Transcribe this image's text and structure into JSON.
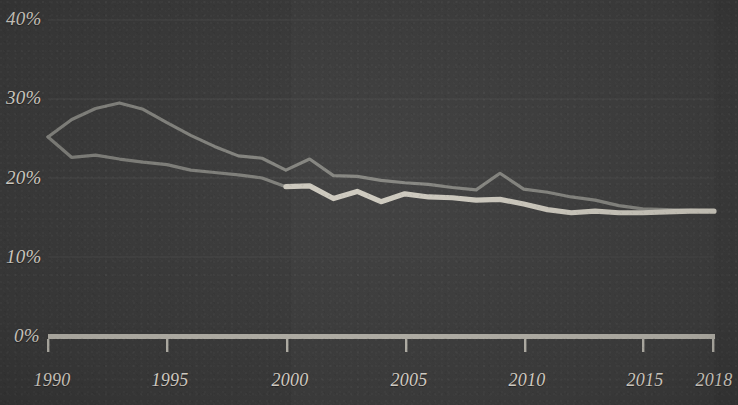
{
  "chart_data": {
    "type": "line",
    "title": "",
    "subtitle": "",
    "xlabel": "",
    "ylabel": "",
    "xlim": [
      1990,
      2018
    ],
    "ylim": [
      0,
      40
    ],
    "grid": true,
    "legend_position": "none",
    "y_ticks": [
      "0%",
      "10%",
      "20%",
      "30%",
      "40%"
    ],
    "y_tick_values": [
      0,
      10,
      20,
      30,
      40
    ],
    "x_ticks": [
      "1990",
      "1995",
      "2000",
      "2005",
      "2010",
      "2015",
      "2018"
    ],
    "x_tick_values": [
      1990,
      1995,
      2000,
      2005,
      2010,
      2015,
      2018
    ],
    "x": [
      1990,
      1991,
      1992,
      1993,
      1994,
      1995,
      1996,
      1997,
      1998,
      1999,
      2000,
      2001,
      2002,
      2003,
      2004,
      2005,
      2006,
      2007,
      2008,
      2009,
      2010,
      2011,
      2012,
      2013,
      2014,
      2015,
      2016,
      2017,
      2018
    ],
    "series": [
      {
        "name": "upper-series",
        "style": "thin",
        "color": "#8e8e88",
        "values": [
          25.2,
          27.4,
          28.8,
          29.5,
          28.7,
          27.0,
          25.4,
          24.0,
          22.8,
          22.5,
          21.0,
          22.4,
          20.3,
          20.2,
          19.7,
          19.4,
          19.2,
          18.8,
          18.5,
          20.6,
          18.6,
          18.2,
          17.6,
          17.2,
          16.5,
          16.1,
          16.0,
          15.9,
          15.8
        ]
      },
      {
        "name": "lower-series",
        "style": "thick",
        "color": "#cfcbc0",
        "start_year": 2000,
        "values": [
          null,
          null,
          null,
          null,
          null,
          null,
          null,
          null,
          null,
          null,
          18.9,
          19.0,
          17.4,
          18.3,
          17.0,
          18.0,
          17.6,
          17.5,
          17.2,
          17.3,
          16.7,
          16.0,
          15.6,
          15.8,
          15.6,
          15.6,
          15.7,
          15.8,
          15.8
        ]
      },
      {
        "name": "lower-series-early",
        "style": "thin",
        "color": "#8a8a84",
        "values": [
          25.2,
          22.6,
          22.9,
          22.4,
          22.0,
          21.7,
          21.0,
          20.7,
          20.4,
          20.0,
          18.9,
          null,
          null,
          null,
          null,
          null,
          null,
          null,
          null,
          null,
          null,
          null,
          null,
          null,
          null,
          null,
          null,
          null,
          null
        ]
      }
    ]
  },
  "axis": {
    "baseline_color": "#b9b6ad",
    "tick_color": "#b9b6ad",
    "gridline_color": "#4a4a4a"
  },
  "colors": {
    "background": "#3c3c3c",
    "label_text": "#ded9cf",
    "series_thin": "#8e8e88",
    "series_thick": "#cfcbc0"
  }
}
